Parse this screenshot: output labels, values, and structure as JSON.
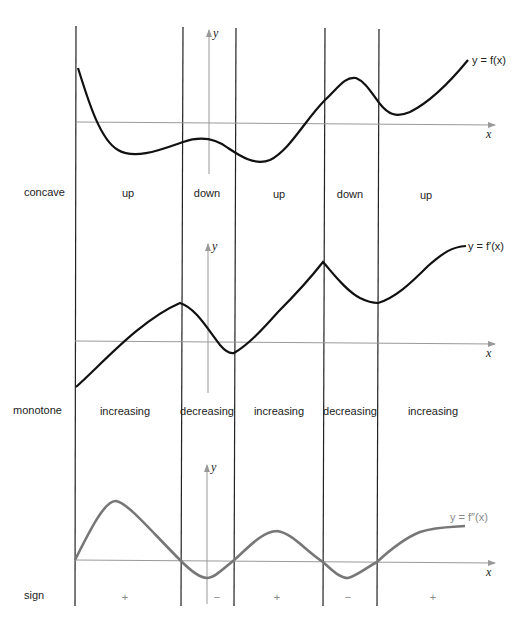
{
  "panels": [
    {
      "id": "f",
      "curve_label": "y = f(x)",
      "row_label": "concave",
      "intervals": [
        "up",
        "down",
        "up",
        "down",
        "up"
      ],
      "axis_labels": {
        "x": "x",
        "y": "y"
      },
      "curve_color": "#111111"
    },
    {
      "id": "fprime",
      "curve_label": "y = f′(x)",
      "row_label": "monotone",
      "intervals": [
        "increasing",
        "decreasing",
        "increasing",
        "decreasing",
        "increasing"
      ],
      "axis_labels": {
        "x": "x",
        "y": "y"
      },
      "curve_color": "#111111"
    },
    {
      "id": "fdoubleprime",
      "curve_label": "y = f″(x)",
      "row_label": "sign",
      "intervals": [
        "+",
        "−",
        "+",
        "−",
        "+"
      ],
      "axis_labels": {
        "x": "x",
        "y": "y"
      },
      "curve_color": "#777777"
    }
  ],
  "colors": {
    "divider": "#222222",
    "axis": "#999999",
    "curve_dark": "#111111",
    "curve_gray": "#777777"
  }
}
